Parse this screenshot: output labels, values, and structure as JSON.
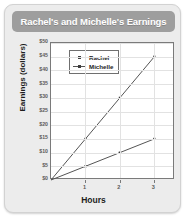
{
  "card": {
    "title": "Rachel's and Michelle's Earnings"
  },
  "chart_data": {
    "type": "line",
    "title": "Rachel's and Michelle's Earnings",
    "xlabel": "Hours",
    "ylabel": "Earnings (dollars)",
    "x": [
      0,
      1,
      2,
      3
    ],
    "xlim": [
      0,
      3.6
    ],
    "ylim": [
      0,
      50
    ],
    "xticks": [
      1,
      2,
      3
    ],
    "xtick_labels": [
      "1",
      "2",
      "3"
    ],
    "yticks": [
      0,
      5,
      10,
      15,
      20,
      25,
      30,
      35,
      40,
      45,
      50
    ],
    "ytick_labels": [
      "$0",
      "$5",
      "$10",
      "$15",
      "$20",
      "$25",
      "$30",
      "$35",
      "$40",
      "$45",
      "$50"
    ],
    "grid": true,
    "legend_position": "upper left",
    "series": [
      {
        "name": "Rachel",
        "values": [
          0,
          5,
          10,
          15
        ],
        "color": "#555555",
        "rate_per_hour": 5
      },
      {
        "name": "Michelle",
        "values": [
          0,
          15,
          30,
          45
        ],
        "color": "#555555",
        "rate_per_hour": 15
      }
    ]
  },
  "legend": {
    "items": [
      {
        "label": "Rachel"
      },
      {
        "label": "Michelle"
      }
    ]
  },
  "axis": {
    "x_title": "Hours",
    "y_title": "Earnings (dollars)"
  }
}
